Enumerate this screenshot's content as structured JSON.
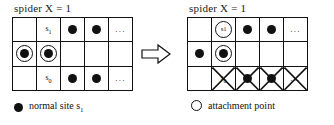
{
  "figure": {
    "type": "diagram",
    "arrow_icon": "right-arrow-outline"
  },
  "panels": [
    {
      "id": "before",
      "title": "spider X = 1",
      "grid": {
        "columns": 5,
        "rows": 3,
        "cells": [
          [
            {
              "glyph": "empty"
            },
            {
              "glyph": "label",
              "text": "s",
              "sub": "1"
            },
            {
              "glyph": "filled-dot"
            },
            {
              "glyph": "filled-dot"
            },
            {
              "glyph": "ellipsis",
              "text": "..."
            }
          ],
          [
            {
              "glyph": "ring-dot"
            },
            {
              "glyph": "ring-dot"
            },
            {
              "glyph": "empty"
            },
            {
              "glyph": "empty"
            },
            {
              "glyph": "empty"
            }
          ],
          [
            {
              "glyph": "empty"
            },
            {
              "glyph": "label",
              "text": "s",
              "sub": "0"
            },
            {
              "glyph": "filled-dot"
            },
            {
              "glyph": "filled-dot"
            },
            {
              "glyph": "ellipsis",
              "text": "..."
            }
          ]
        ]
      },
      "legend": {
        "swatch": "filled-dot",
        "text": "normal site s",
        "sub": "1"
      }
    },
    {
      "id": "after",
      "title": "spider X = 1",
      "grid": {
        "columns": 5,
        "rows": 3,
        "cells": [
          [
            {
              "glyph": "empty"
            },
            {
              "glyph": "open-circle-label",
              "text": "s",
              "sub": "1"
            },
            {
              "glyph": "filled-dot"
            },
            {
              "glyph": "filled-dot"
            },
            {
              "glyph": "ellipsis",
              "text": "..."
            }
          ],
          [
            {
              "glyph": "filled-dot"
            },
            {
              "glyph": "ring-dot"
            },
            {
              "glyph": "empty"
            },
            {
              "glyph": "empty"
            },
            {
              "glyph": "empty"
            }
          ],
          [
            {
              "glyph": "empty"
            },
            {
              "glyph": "label",
              "text": "s",
              "sub": "0",
              "crossed": true
            },
            {
              "glyph": "filled-dot",
              "crossed": true
            },
            {
              "glyph": "filled-dot",
              "crossed": true
            },
            {
              "glyph": "ellipsis",
              "text": "...",
              "crossed": true
            }
          ]
        ]
      },
      "legend": {
        "swatch": "open-circle",
        "text": "attachment point",
        "sub": ""
      }
    }
  ]
}
